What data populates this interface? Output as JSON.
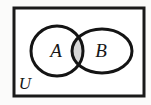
{
  "figure": {
    "kind": "venn-diagram",
    "background_color": "#fbfbfa"
  },
  "universe": {
    "label": "U",
    "border_color": "#1a1a1a",
    "fill_color": "#ffffff",
    "x": 14,
    "y": 8,
    "width": 130,
    "height": 88,
    "stroke_width": 3,
    "label_x": 25,
    "label_y": 89
  },
  "sets": [
    {
      "id": "set-a",
      "label": "A",
      "shape": "ellipse",
      "cx": 57,
      "cy": 51,
      "rx": 26,
      "ry": 25,
      "stroke_color": "#141414",
      "stroke_width": 3,
      "fill_color": "#ffffff",
      "label_x": 56,
      "label_y": 57
    },
    {
      "id": "set-b",
      "label": "B",
      "shape": "ellipse",
      "cx": 102,
      "cy": 51,
      "rx": 30,
      "ry": 22,
      "stroke_color": "#141414",
      "stroke_width": 3,
      "fill_color": "#ffffff",
      "label_x": 101,
      "label_y": 57
    }
  ],
  "intersection": {
    "id": "a-intersect-b",
    "label": "",
    "shaded": true,
    "fill_color": "#d6d6d6",
    "description": "A intersect B region shaded gray"
  }
}
